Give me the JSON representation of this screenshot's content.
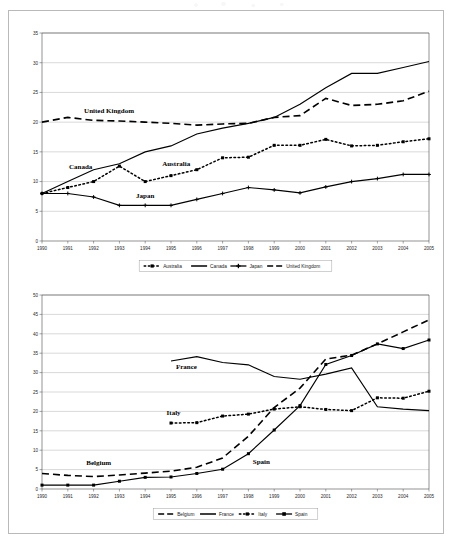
{
  "document": {
    "background_color": "#ffffff",
    "frame_border_color": "#b9b9b9"
  },
  "chart_data": [
    {
      "id": "top",
      "type": "line",
      "title": "",
      "xlabel": "",
      "ylabel": "",
      "grid": true,
      "legend_position": "bottom",
      "xlim": [
        1990,
        2005
      ],
      "ylim": [
        0,
        35
      ],
      "ytick_step": 5,
      "categories": [
        "1990",
        "1991",
        "1992",
        "1993",
        "1994",
        "1995",
        "1996",
        "1997",
        "1998",
        "1999",
        "2000",
        "2001",
        "2002",
        "2003",
        "2004",
        "2005"
      ],
      "yticks": [
        "0",
        "5",
        "10",
        "15",
        "20",
        "25",
        "30",
        "35"
      ],
      "series": [
        {
          "name": "Australia",
          "style": "dotted-square",
          "values": [
            8.0,
            9.0,
            10.0,
            12.6,
            10.0,
            11.0,
            12.0,
            14.0,
            14.1,
            16.1,
            16.1,
            17.1,
            16.0,
            16.1,
            16.7,
            17.2
          ]
        },
        {
          "name": "Canada",
          "style": "solid",
          "values": [
            8.0,
            10.0,
            12.0,
            13.0,
            15.0,
            16.0,
            18.0,
            19.0,
            19.8,
            20.8,
            23.0,
            25.8,
            28.2,
            28.2,
            29.2,
            30.2
          ]
        },
        {
          "name": "Japan",
          "style": "solid-plus",
          "values": [
            8.0,
            8.0,
            7.4,
            6.0,
            6.0,
            6.0,
            7.0,
            8.0,
            9.0,
            8.6,
            8.1,
            9.1,
            10.0,
            10.5,
            11.2,
            11.2
          ]
        },
        {
          "name": "United Kingdom",
          "style": "dashed",
          "values": [
            20.0,
            20.8,
            20.3,
            20.2,
            20.0,
            19.8,
            19.5,
            19.7,
            19.8,
            20.8,
            21.1,
            24.0,
            22.8,
            23.0,
            23.6,
            25.2
          ]
        }
      ],
      "annotations": [
        {
          "text": "United Kingdom",
          "x": 1992.6,
          "y": 21.6
        },
        {
          "text": "Canada",
          "x": 1991.5,
          "y": 12.1
        },
        {
          "text": "Australia",
          "x": 1995.2,
          "y": 12.6
        },
        {
          "text": "Japan",
          "x": 1994.0,
          "y": 7.2
        }
      ],
      "legend": [
        "Australia",
        "Canada",
        "Japan",
        "United Kingdom"
      ]
    },
    {
      "id": "bottom",
      "type": "line",
      "title": "",
      "xlabel": "",
      "ylabel": "",
      "grid": true,
      "legend_position": "bottom",
      "xlim": [
        1990,
        2005
      ],
      "ylim": [
        0,
        50
      ],
      "ytick_step": 5,
      "categories": [
        "1990",
        "1991",
        "1992",
        "1993",
        "1994",
        "1995",
        "1996",
        "1997",
        "1998",
        "1999",
        "2000",
        "2001",
        "2002",
        "2003",
        "2004",
        "2005"
      ],
      "yticks": [
        "0",
        "5",
        "10",
        "15",
        "20",
        "25",
        "30",
        "35",
        "40",
        "45",
        "50"
      ],
      "series": [
        {
          "name": "Belgium",
          "style": "dashed",
          "values": [
            4.0,
            3.5,
            3.2,
            3.6,
            4.1,
            4.6,
            5.6,
            8.0,
            13.6,
            21.0,
            26.0,
            33.5,
            34.5,
            37.4,
            40.5,
            43.6
          ]
        },
        {
          "name": "France",
          "style": "solid",
          "values": [
            null,
            null,
            null,
            null,
            null,
            33.0,
            34.1,
            32.6,
            32.0,
            29.0,
            28.3,
            29.6,
            31.2,
            21.2,
            20.6,
            20.2
          ]
        },
        {
          "name": "Italy",
          "style": "dotted-square",
          "values": [
            null,
            null,
            null,
            null,
            null,
            17.0,
            17.1,
            18.8,
            19.3,
            20.6,
            21.2,
            20.5,
            20.2,
            23.5,
            23.4,
            25.2
          ]
        },
        {
          "name": "Spain",
          "style": "solid-square",
          "values": [
            1.0,
            1.0,
            1.0,
            2.0,
            3.0,
            3.1,
            4.0,
            5.1,
            9.1,
            15.2,
            21.5,
            32.1,
            34.4,
            37.4,
            36.2,
            38.4
          ]
        }
      ],
      "annotations": [
        {
          "text": "France",
          "x": 1995.6,
          "y": 31.0
        },
        {
          "text": "Italy",
          "x": 1995.1,
          "y": 19.0
        },
        {
          "text": "Belgium",
          "x": 1992.2,
          "y": 6.2
        },
        {
          "text": "Spain",
          "x": 1998.5,
          "y": 6.4
        }
      ],
      "legend": [
        "Belgium",
        "France",
        "Italy",
        "Spain"
      ]
    }
  ]
}
